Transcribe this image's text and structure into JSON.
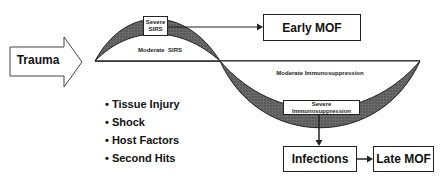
{
  "diagram": {
    "trauma_label": "Trauma",
    "sirs": {
      "severe_label_line1": "Severe",
      "severe_label_line2": "SIRS",
      "moderate_label": "Moderate  SIRS"
    },
    "early_mof_label": "Early MOF",
    "immunosuppression": {
      "moderate_label": "Moderate Immunosuppression",
      "severe_label_line1": "Severe",
      "severe_label_line2": "Immunosuppression"
    },
    "factors": [
      "• Tissue Injury",
      "• Shock",
      "• Host Factors",
      "• Second Hits"
    ],
    "infections_label": "Infections",
    "late_mof_label": "Late MOF",
    "colors": {
      "line": "#222222",
      "shade": "#555555",
      "background": "#ffffff"
    }
  }
}
